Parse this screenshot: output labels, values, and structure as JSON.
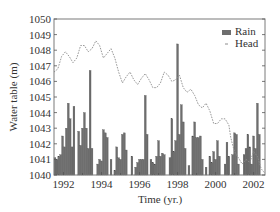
{
  "chart_data": {
    "type": "bar+line",
    "title": "",
    "xlabel": "Time (yr.)",
    "ylabel": "Water table (m)",
    "xlim": [
      1991.5,
      2002.6
    ],
    "ylim": [
      1040,
      1050
    ],
    "x_ticks": [
      1992,
      1994,
      1996,
      1998,
      2000,
      2002
    ],
    "y_ticks": [
      1040,
      1041,
      1042,
      1043,
      1044,
      1045,
      1046,
      1047,
      1048,
      1049,
      1050
    ],
    "grid": false,
    "legend": {
      "position": "upper right",
      "entries": [
        {
          "label": "Rain",
          "type": "bar",
          "color": "#6e6e6e"
        },
        {
          "label": "Head",
          "type": "dashed-line",
          "color": "#8c8c8c"
        }
      ]
    },
    "series": [
      {
        "name": "Head",
        "type": "line",
        "x": [
          1991.5,
          1991.7,
          1991.9,
          1992.1,
          1992.3,
          1992.5,
          1992.7,
          1992.9,
          1993.1,
          1993.3,
          1993.5,
          1993.7,
          1993.9,
          1994.1,
          1994.3,
          1994.5,
          1994.7,
          1994.9,
          1995.1,
          1995.3,
          1995.5,
          1995.7,
          1995.9,
          1996.1,
          1996.3,
          1996.5,
          1996.7,
          1996.9,
          1997.1,
          1997.3,
          1997.5,
          1997.7,
          1997.9,
          1998.1,
          1998.3,
          1998.5,
          1998.7,
          1998.9,
          1999.1,
          1999.3,
          1999.5,
          1999.7,
          1999.9,
          2000.1,
          2000.3,
          2000.5,
          2000.7,
          2000.8,
          2000.9,
          2001.0,
          2001.2,
          2001.4,
          2001.6,
          2001.8,
          2002.0,
          2002.2,
          2002.4,
          2002.6
        ],
        "y": [
          1046.6,
          1046.8,
          1047.6,
          1047.9,
          1047.6,
          1047.2,
          1047.5,
          1048.3,
          1048.3,
          1047.9,
          1048.1,
          1048.6,
          1048.3,
          1047.5,
          1047.8,
          1048.1,
          1047.5,
          1046.6,
          1045.9,
          1046.3,
          1046.6,
          1046.1,
          1045.8,
          1046.2,
          1046.5,
          1046.1,
          1045.6,
          1045.6,
          1045.9,
          1046.6,
          1046.4,
          1046.0,
          1046.1,
          1046.4,
          1045.6,
          1045.3,
          1045.5,
          1045.1,
          1044.5,
          1044.3,
          1044.6,
          1044.1,
          1043.3,
          1043.3,
          1043.6,
          1043.6,
          1043.2,
          1042.4,
          1041.9,
          1041.5,
          1041.1,
          1040.7,
          1041.0,
          1040.8,
          1041.5,
          1041.2,
          1040.4,
          1040.1
        ]
      },
      {
        "name": "Rain",
        "type": "bar",
        "x": [
          1991.55,
          1991.65,
          1991.75,
          1991.85,
          1991.95,
          1992.05,
          1992.15,
          1992.25,
          1992.35,
          1992.45,
          1992.55,
          1992.7,
          1992.8,
          1992.9,
          1993.0,
          1993.1,
          1993.2,
          1993.3,
          1993.4,
          1993.5,
          1993.8,
          1993.9,
          1994.0,
          1994.1,
          1994.2,
          1994.3,
          1994.5,
          1994.7,
          1994.8,
          1994.9,
          1995.0,
          1995.1,
          1995.2,
          1995.3,
          1995.6,
          1995.8,
          1995.9,
          1996.0,
          1996.1,
          1996.2,
          1996.3,
          1996.4,
          1996.6,
          1996.7,
          1996.8,
          1996.9,
          1997.0,
          1997.1,
          1997.2,
          1997.3,
          1997.6,
          1997.7,
          1997.8,
          1997.9,
          1998.0,
          1998.1,
          1998.2,
          1998.3,
          1998.4,
          1998.6,
          1998.8,
          1998.9,
          1999.0,
          1999.1,
          1999.2,
          1999.3,
          1999.5,
          1999.7,
          1999.8,
          1999.9,
          2000.0,
          2000.1,
          2000.2,
          2000.5,
          2000.6,
          2000.7,
          2000.9,
          2001.0,
          2001.1,
          2001.2,
          2001.5,
          2001.6,
          2001.7,
          2001.8,
          2001.9,
          2002.0,
          2002.1,
          2002.2,
          2002.3
        ],
        "y": [
          1041.1,
          1041.0,
          1041.2,
          1041.3,
          1042.5,
          1041.8,
          1043.0,
          1044.6,
          1043.6,
          1041.8,
          1044.4,
          1040.0,
          1042.8,
          1041.9,
          1043.0,
          1044.0,
          1043.0,
          1041.7,
          1046.7,
          1041.7,
          1040.7,
          1041.0,
          1040.9,
          1042.9,
          1042.7,
          1042.4,
          1041.0,
          1040.3,
          1041.8,
          1041.1,
          1041.0,
          1042.6,
          1042.7,
          1041.6,
          1041.2,
          1040.5,
          1040.8,
          1041.0,
          1041.0,
          1041.0,
          1045.1,
          1042.6,
          1041.0,
          1040.8,
          1040.7,
          1041.2,
          1042.2,
          1041.2,
          1041.4,
          1041.3,
          1041.1,
          1043.6,
          1041.5,
          1042.2,
          1048.4,
          1042.6,
          1044.5,
          1043.4,
          1041.7,
          1040.6,
          1042.5,
          1043.4,
          1042.4,
          1042.4,
          1042.5,
          1041.0,
          1040.5,
          1041.2,
          1040.8,
          1041.5,
          1041.0,
          1042.2,
          1041.2,
          1040.7,
          1042.1,
          1041.2,
          1041.3,
          1042.7,
          1042.6,
          1040.7,
          1041.3,
          1041.7,
          1042.6,
          1041.8,
          1040.7,
          1042.5,
          1041.7,
          1044.6,
          1042.6
        ]
      }
    ]
  },
  "axes": {
    "x_label": "Time (yr.)",
    "y_label": "Water table (m)",
    "x_tick_labels": [
      "1992",
      "1994",
      "1996",
      "1998",
      "2000",
      "2002"
    ],
    "y_tick_labels": [
      "1040",
      "1041",
      "1042",
      "1043",
      "1044",
      "1045",
      "1046",
      "1047",
      "1048",
      "1049",
      "1050"
    ]
  },
  "legend": {
    "rain_label": "Rain",
    "head_label": "Head"
  },
  "colors": {
    "bar": "#6e6e6e",
    "line": "#8c8c8c",
    "frame": "#7a7a7a"
  }
}
